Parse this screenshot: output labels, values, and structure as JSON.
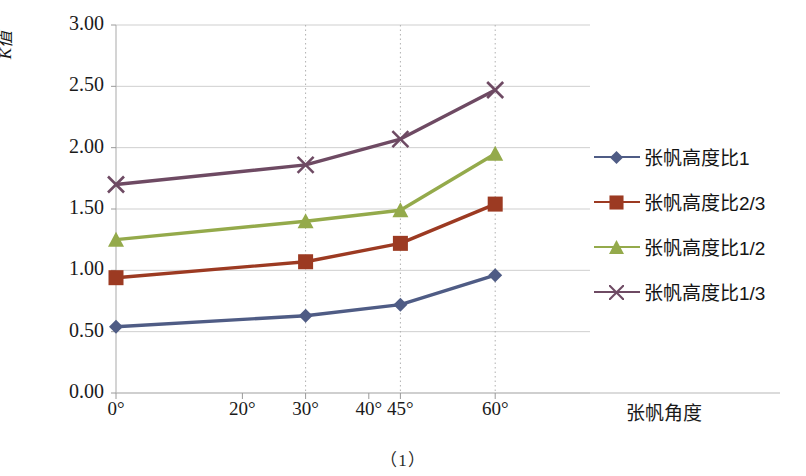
{
  "figure": {
    "caption": "（1）",
    "background": "#ffffff"
  },
  "chart_data": {
    "type": "line",
    "title": "",
    "xlabel": "张帆角度",
    "ylabel": "K值",
    "x_tick_labels": [
      "0°",
      "20°",
      "30°",
      "40°",
      "45°",
      "60°"
    ],
    "x_tick_values": [
      0,
      20,
      30,
      40,
      45,
      60
    ],
    "x_data_positions": [
      0,
      30,
      45,
      60
    ],
    "xlim": [
      0,
      75
    ],
    "ylim": [
      0.0,
      3.0
    ],
    "y_tick_labels": [
      "0.00",
      "0.50",
      "1.00",
      "1.50",
      "2.00",
      "2.50",
      "3.00"
    ],
    "y_tick_values": [
      0.0,
      0.5,
      1.0,
      1.5,
      2.0,
      2.5,
      3.0
    ],
    "grid": "horizontal",
    "legend_position": "right",
    "categories": [
      "0°",
      "30°",
      "45°",
      "60°"
    ],
    "series": [
      {
        "name": "张帆高度比1",
        "color": "#4f5c85",
        "marker": "diamond",
        "values": [
          0.54,
          0.63,
          0.72,
          0.96
        ]
      },
      {
        "name": "张帆高度比2/3",
        "color": "#9c3a22",
        "marker": "square",
        "values": [
          0.94,
          1.07,
          1.22,
          1.54
        ]
      },
      {
        "name": "张帆高度比1/2",
        "color": "#94aa4b",
        "marker": "triangle",
        "values": [
          1.25,
          1.4,
          1.49,
          1.95
        ]
      },
      {
        "name": "张帆高度比1/3",
        "color": "#6e4a63",
        "marker": "cross",
        "values": [
          1.7,
          1.86,
          2.07,
          2.47
        ]
      }
    ],
    "dropline_positions": [
      30,
      45,
      60
    ],
    "axis_color": "#b8b8b8",
    "grid_color": "#cfcfcf"
  }
}
